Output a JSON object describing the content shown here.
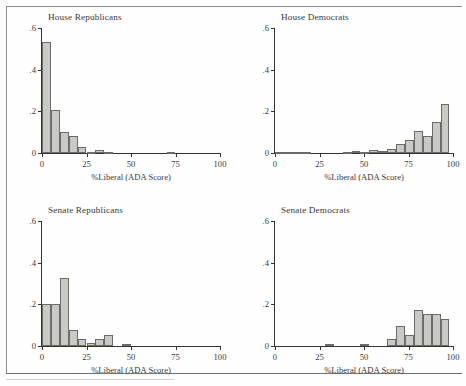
{
  "figure": {
    "title": "",
    "x_axis_title": "%Liberal (ADA Score)",
    "y_ticks": [
      "0",
      ".2",
      ".4",
      ".6"
    ],
    "x_ticks": [
      "0",
      "25",
      "50",
      "75",
      "100"
    ]
  },
  "panels": [
    {
      "id": "house-republicans",
      "title": "House Republicans"
    },
    {
      "id": "house-democrats",
      "title": "House Democrats"
    },
    {
      "id": "senate-republicans",
      "title": "Senate Republicans"
    },
    {
      "id": "senate-democrats",
      "title": "Senate Democrats"
    }
  ],
  "chart_data": [
    {
      "type": "bar",
      "title": "House Republicans",
      "xlabel": "%Liberal (ADA Score)",
      "ylabel": "",
      "xlim": [
        0,
        100
      ],
      "ylim": [
        0,
        0.6
      ],
      "yticks": [
        0,
        0.2,
        0.4,
        0.6
      ],
      "xticks": [
        0,
        25,
        50,
        75,
        100
      ],
      "grid": false,
      "legend": "none",
      "bin_width": 5,
      "bin_starts": [
        0,
        5,
        10,
        15,
        20,
        25,
        30,
        35,
        70
      ],
      "values": [
        0.535,
        0.208,
        0.099,
        0.082,
        0.028,
        0.006,
        0.016,
        0.003,
        0.004
      ]
    },
    {
      "type": "bar",
      "title": "House Democrats",
      "xlabel": "%Liberal (ADA Score)",
      "ylabel": "",
      "xlim": [
        0,
        100
      ],
      "ylim": [
        0,
        0.6
      ],
      "yticks": [
        0,
        0.2,
        0.4,
        0.6
      ],
      "xticks": [
        0,
        25,
        50,
        75,
        100
      ],
      "grid": false,
      "legend": "none",
      "bin_width": 5,
      "bin_starts": [
        0,
        5,
        10,
        38,
        43,
        48,
        53,
        58,
        63,
        68,
        73,
        78,
        83,
        88,
        93
      ],
      "values": [
        0.004,
        0.004,
        0.004,
        0.006,
        0.012,
        0.0,
        0.016,
        0.01,
        0.021,
        0.044,
        0.062,
        0.104,
        0.08,
        0.147,
        0.234
      ]
    },
    {
      "type": "bar",
      "title": "Senate Republicans",
      "xlabel": "%Liberal (ADA Score)",
      "ylabel": "",
      "xlim": [
        0,
        100
      ],
      "ylim": [
        0,
        0.6
      ],
      "yticks": [
        0,
        0.2,
        0.4,
        0.6
      ],
      "xticks": [
        0,
        25,
        50,
        75,
        100
      ],
      "grid": false,
      "legend": "none",
      "bin_width": 5,
      "bin_starts": [
        0,
        5,
        10,
        15,
        20,
        25,
        30,
        35,
        45
      ],
      "values": [
        0.2,
        0.2,
        0.327,
        0.078,
        0.034,
        0.014,
        0.032,
        0.051,
        0.011
      ]
    },
    {
      "type": "bar",
      "title": "Senate Democrats",
      "xlabel": "%Liberal (ADA Score)",
      "ylabel": "",
      "xlim": [
        0,
        100
      ],
      "ylim": [
        0,
        0.6
      ],
      "yticks": [
        0,
        0.2,
        0.4,
        0.6
      ],
      "xticks": [
        0,
        25,
        50,
        75,
        100
      ],
      "grid": false,
      "legend": "none",
      "bin_width": 5,
      "bin_starts": [
        28,
        48,
        63,
        68,
        73,
        78,
        83,
        88,
        93
      ],
      "values": [
        0.011,
        0.011,
        0.033,
        0.095,
        0.055,
        0.172,
        0.152,
        0.152,
        0.13,
        0.112
      ]
    }
  ]
}
